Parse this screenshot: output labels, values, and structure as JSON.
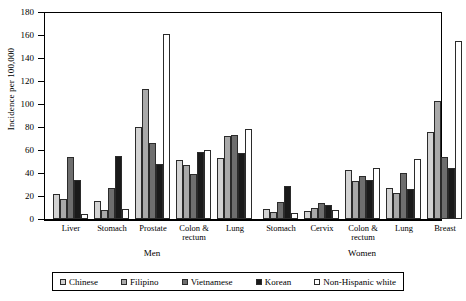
{
  "chart_data": {
    "type": "bar",
    "title": "",
    "xlabel": "",
    "ylabel": "Incidence per 100,000",
    "ylim": [
      0,
      180
    ],
    "ytick_step": 20,
    "yticks": [
      180,
      160,
      140,
      120,
      100,
      80,
      60,
      40,
      20,
      0
    ],
    "grid": false,
    "legend_position": "bottom",
    "series": [
      {
        "name": "Chinese",
        "swatch": "#d2d2d2",
        "values": [
          22,
          16,
          80,
          51,
          53,
          9,
          7,
          43,
          27,
          76
        ]
      },
      {
        "name": "Filipino",
        "swatch": "#a9a9a9",
        "values": [
          17,
          8,
          113,
          47,
          72,
          6,
          10,
          33,
          23,
          103
        ]
      },
      {
        "name": "Vietnamese",
        "swatch": "#6e6e6e",
        "values": [
          54,
          27,
          66,
          39,
          73,
          15,
          14,
          37,
          40,
          54
        ]
      },
      {
        "name": "Korean",
        "swatch": "#1a1a1a",
        "values": [
          34,
          55,
          48,
          58,
          57,
          29,
          12,
          34,
          26,
          44
        ]
      },
      {
        "name": "Non-Hispanic white",
        "swatch": "#ffffff",
        "values": [
          4,
          9,
          161,
          60,
          78,
          5,
          8,
          44,
          52,
          155
        ]
      }
    ],
    "categories": [
      {
        "label": "Liver",
        "sex": "Men"
      },
      {
        "label": "Stomach",
        "sex": "Men"
      },
      {
        "label": "Prostate",
        "sex": "Men"
      },
      {
        "label": "Colon &\nrectum",
        "sex": "Men"
      },
      {
        "label": "Lung",
        "sex": "Men"
      },
      {
        "label": "Stomach",
        "sex": "Women"
      },
      {
        "label": "Cervix",
        "sex": "Women"
      },
      {
        "label": "Colon &\nrectum",
        "sex": "Women"
      },
      {
        "label": "Lung",
        "sex": "Women"
      },
      {
        "label": "Breast",
        "sex": "Women"
      }
    ],
    "groups": [
      {
        "sex": "Men",
        "label": "Men"
      },
      {
        "sex": "Women",
        "label": "Women"
      }
    ]
  },
  "axis": {
    "y_label": "Incidence per 100,000",
    "y_ticks": [
      "180",
      "160",
      "140",
      "120",
      "100",
      "80",
      "60",
      "40",
      "20",
      "0"
    ]
  },
  "categories_flat": [
    "Liver",
    "Stomach",
    "Prostate",
    "Colon &\nrectum",
    "Lung",
    "Stomach",
    "Cervix",
    "Colon &\nrectum",
    "Lung",
    "Breast"
  ],
  "sex_labels": {
    "men": "Men",
    "women": "Women"
  },
  "legend": {
    "items": [
      {
        "label": "Chinese",
        "color": "#d2d2d2"
      },
      {
        "label": "Filipino",
        "color": "#a9a9a9"
      },
      {
        "label": "Vietnamese",
        "color": "#6e6e6e"
      },
      {
        "label": "Korean",
        "color": "#1a1a1a"
      },
      {
        "label": "Non-Hispanic white",
        "color": "#ffffff"
      }
    ]
  }
}
